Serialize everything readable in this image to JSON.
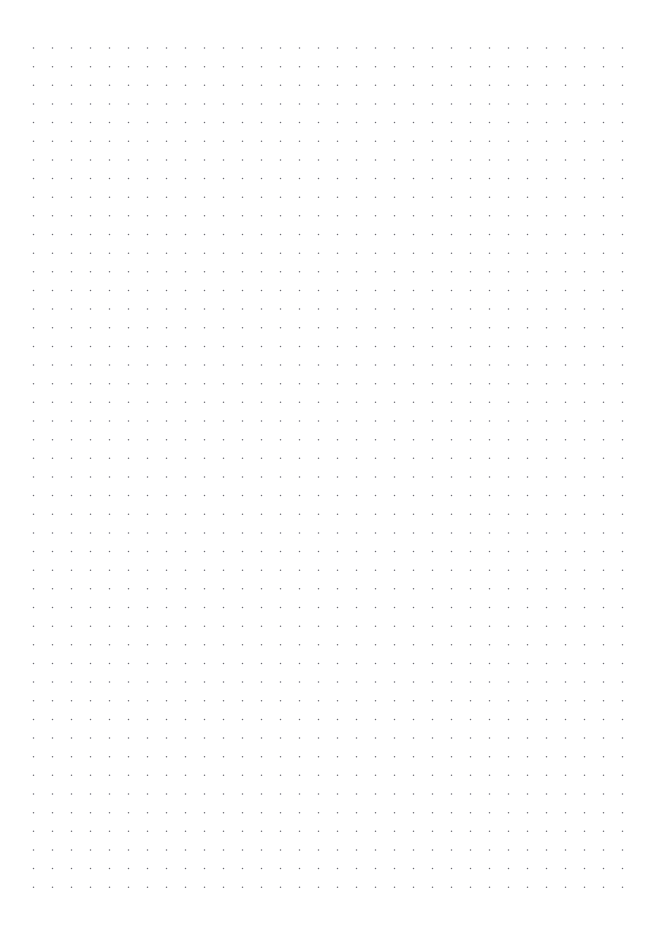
{
  "document": {
    "kind": "dot-grid-paper",
    "title": "Dot Grid Paper",
    "page_width": 656,
    "page_height": 930,
    "background_color": "#ffffff",
    "has_visible_text": false,
    "has_page_border": false
  },
  "grid": {
    "dot_color": "#6b6b73",
    "dot_radius": 0.75,
    "spacing_x": 19.0,
    "spacing_y": 18.65,
    "origin_x": 33.5,
    "origin_y": 48.0,
    "columns": 32,
    "rows": 46,
    "shape": "circle"
  },
  "margins": {
    "top_label": "top margin",
    "bottom_label": "bottom margin",
    "left_label": "left margin",
    "right_label": "right margin",
    "top": 48,
    "bottom": 44,
    "left": 33,
    "right": 33
  }
}
